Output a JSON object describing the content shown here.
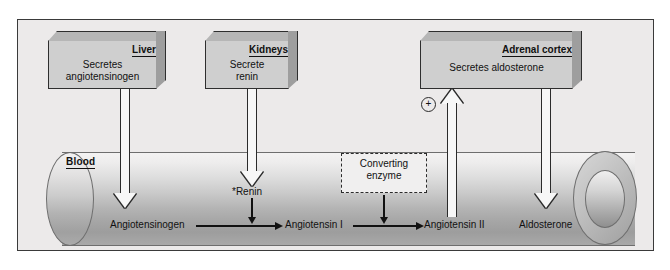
{
  "diagram": {
    "frame_background": "#eceaea",
    "vessel_label": "Blood"
  },
  "boxes": [
    {
      "id": "liver",
      "title": "Liver",
      "body": "Secretes\nangiotensinogen",
      "body_line1": "Secretes",
      "body_line2": "angiotensinogen"
    },
    {
      "id": "kidneys",
      "title": "Kidneys",
      "body": "Secrete\nrenin",
      "body_line1": "Secrete",
      "body_line2": "renin"
    },
    {
      "id": "adrenal",
      "title": "Adrenal cortex",
      "body": "Secretes aldosterone",
      "body_line1": "Secretes aldosterone",
      "body_line2": ""
    }
  ],
  "enzyme_box": {
    "line1": "Converting",
    "line2": "enzyme"
  },
  "molecules": [
    {
      "id": "angiotensinogen",
      "label": "Angiotensinogen"
    },
    {
      "id": "renin",
      "label": "*Renin"
    },
    {
      "id": "angiotensin1",
      "label": "Angiotensin I"
    },
    {
      "id": "angiotensin2",
      "label": "Angiotensin II"
    },
    {
      "id": "aldosterone",
      "label": "Aldosterone"
    }
  ],
  "symbols": {
    "plus": "+"
  }
}
